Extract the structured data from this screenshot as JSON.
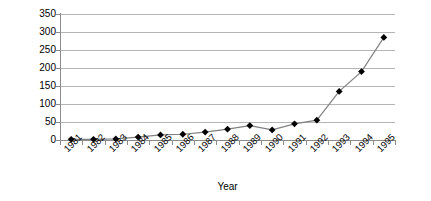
{
  "chart_data": {
    "type": "line",
    "title": "",
    "xlabel": "Year",
    "ylabel": "Millions of RMB",
    "categories": [
      "1981",
      "1982",
      "1983",
      "1984",
      "1985",
      "1986",
      "1987",
      "1988",
      "1989",
      "1990",
      "1991",
      "1992",
      "1993",
      "1994",
      "1995"
    ],
    "values": [
      2,
      2,
      3,
      8,
      14,
      16,
      22,
      30,
      40,
      28,
      45,
      55,
      135,
      190,
      285
    ],
    "series": [
      {
        "name": "Millions of RMB",
        "values": [
          2,
          2,
          3,
          8,
          14,
          16,
          22,
          30,
          40,
          28,
          45,
          55,
          135,
          190,
          285
        ]
      }
    ],
    "ylim": [
      0,
      350
    ],
    "y_ticks": [
      0,
      50,
      100,
      150,
      200,
      250,
      300,
      350
    ],
    "y_tick_labels": [
      "0",
      "50",
      "100",
      "150",
      "200",
      "250",
      "300",
      "350"
    ],
    "grid": "horizontal",
    "legend": "none",
    "marker": "diamond",
    "line_color": "#808080",
    "marker_color": "#000000",
    "gridline_color": "#b5b5b5",
    "axis_color": "#8c8c8c",
    "background_color": "#ffffff"
  }
}
